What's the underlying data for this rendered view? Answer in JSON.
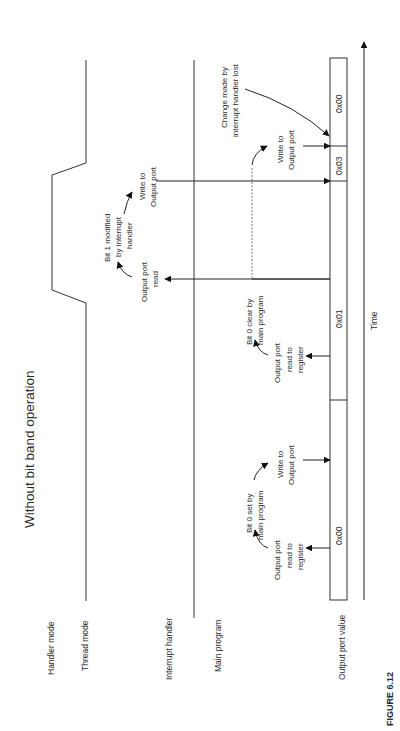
{
  "figure": {
    "title": "Without bit band operation",
    "caption": "FIGURE 6.12"
  },
  "lanes": {
    "handler_mode": "Handler mode",
    "thread_mode": "Thread mode",
    "interrupt_handler": "Interrupt handler",
    "main_program": "Main program",
    "output_port_value": "Output port value"
  },
  "register_values": [
    "0x00",
    "0x01",
    "0x03",
    "0x00"
  ],
  "time_axis": {
    "label": "Time"
  },
  "annotations": {
    "read1_line1": "Output port",
    "read1_line2": "read to",
    "read1_line3": "register",
    "bit0set_line1": "Bit 0 set by",
    "bit0set_line2": "main program",
    "write1_line1": "Write to",
    "write1_line2": "Output port",
    "read2_line1": "Output port",
    "read2_line2": "read to",
    "read2_line3": "register",
    "bit0clear_line1": "Bit 0 clear by",
    "bit0clear_line2": "main program",
    "isrread_line1": "Output port",
    "isrread_line2": "read",
    "bit1mod_line1": "Bit 1 modified",
    "bit1mod_line2": "by interrupt",
    "bit1mod_line3": "handler",
    "isrwrite_line1": "Write to",
    "isrwrite_line2": "Output port",
    "write2_line1": "Write to",
    "write2_line2": "Output port",
    "lost_line1": "Change made by",
    "lost_line2": "interrupt handler lost"
  }
}
